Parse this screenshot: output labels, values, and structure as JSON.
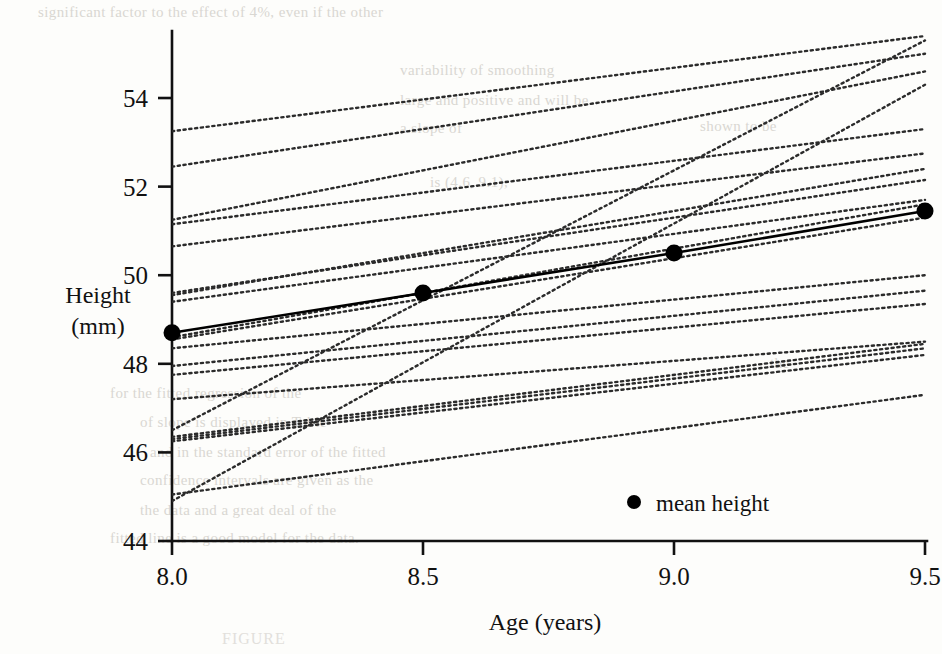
{
  "chart_data": {
    "type": "line",
    "title": "",
    "xlabel": "Age (years)",
    "ylabel": "Height (mm)",
    "ylabel_line1": "Height",
    "ylabel_line2": "(mm)",
    "xlim": [
      8.0,
      9.5
    ],
    "ylim": [
      44,
      55.4
    ],
    "xticks": [
      8.0,
      8.5,
      9.0,
      9.5
    ],
    "xticklabels": [
      "8.0",
      "8.5",
      "9.0",
      "9.5"
    ],
    "yticks": [
      44,
      46,
      48,
      50,
      52,
      54
    ],
    "yticklabels": [
      "44",
      "46",
      "48",
      "50",
      "52",
      "54"
    ],
    "grid": false,
    "legend": {
      "position": "inside-bottom-right",
      "entries": [
        {
          "label": "mean height",
          "marker": "filled-circle",
          "color": "#000000"
        }
      ]
    },
    "x": [
      8.0,
      9.5
    ],
    "series": [
      {
        "name": "mean height",
        "style": "solid",
        "marker": "filled-circle",
        "color": "#000000",
        "linewidth": 2.6,
        "x": [
          8.0,
          8.5,
          9.0,
          9.5
        ],
        "values": [
          48.7,
          49.6,
          50.5,
          51.45
        ]
      },
      {
        "name": "subject-01",
        "style": "dotted",
        "color": "#2b2b2b",
        "x": [
          8.0,
          9.5
        ],
        "values": [
          53.25,
          55.4
        ]
      },
      {
        "name": "subject-02",
        "style": "dotted",
        "color": "#2b2b2b",
        "x": [
          8.0,
          9.5
        ],
        "values": [
          52.45,
          55.0
        ]
      },
      {
        "name": "subject-03",
        "style": "dotted",
        "color": "#2b2b2b",
        "x": [
          8.0,
          9.5
        ],
        "values": [
          51.25,
          54.6
        ]
      },
      {
        "name": "subject-04",
        "style": "dotted",
        "color": "#2b2b2b",
        "x": [
          8.0,
          9.5
        ],
        "values": [
          51.15,
          53.3
        ]
      },
      {
        "name": "subject-05",
        "style": "dotted",
        "color": "#2b2b2b",
        "x": [
          8.0,
          9.5
        ],
        "values": [
          50.65,
          52.75
        ]
      },
      {
        "name": "subject-06",
        "style": "dotted",
        "color": "#2b2b2b",
        "x": [
          8.0,
          9.5
        ],
        "values": [
          49.6,
          52.15
        ]
      },
      {
        "name": "subject-07",
        "style": "dotted",
        "color": "#2b2b2b",
        "x": [
          8.0,
          9.5
        ],
        "values": [
          49.4,
          51.7
        ]
      },
      {
        "name": "subject-08",
        "style": "dotted",
        "color": "#2b2b2b",
        "x": [
          8.0,
          9.5
        ],
        "values": [
          48.55,
          51.3
        ]
      },
      {
        "name": "subject-09",
        "style": "dotted",
        "color": "#2b2b2b",
        "x": [
          8.0,
          9.5
        ],
        "values": [
          48.35,
          50.0
        ]
      },
      {
        "name": "subject-10",
        "style": "dotted",
        "color": "#2b2b2b",
        "x": [
          8.0,
          9.5
        ],
        "values": [
          47.95,
          49.65
        ]
      },
      {
        "name": "subject-11",
        "style": "dotted",
        "color": "#2b2b2b",
        "x": [
          8.0,
          9.5
        ],
        "values": [
          47.75,
          49.35
        ]
      },
      {
        "name": "subject-12",
        "style": "dotted",
        "color": "#2b2b2b",
        "x": [
          8.0,
          9.5
        ],
        "values": [
          47.2,
          48.5
        ]
      },
      {
        "name": "subject-13",
        "style": "dotted",
        "color": "#2b2b2b",
        "x": [
          8.0,
          9.5
        ],
        "values": [
          46.35,
          48.45
        ]
      },
      {
        "name": "subject-14",
        "style": "dotted",
        "color": "#2b2b2b",
        "x": [
          8.0,
          9.5
        ],
        "values": [
          46.3,
          48.35
        ]
      },
      {
        "name": "subject-15",
        "style": "dotted",
        "color": "#2b2b2b",
        "x": [
          8.0,
          9.5
        ],
        "values": [
          46.25,
          48.2
        ]
      },
      {
        "name": "subject-16",
        "style": "dotted",
        "color": "#2b2b2b",
        "x": [
          8.0,
          9.5
        ],
        "values": [
          45.05,
          47.3
        ]
      },
      {
        "name": "subject-17",
        "style": "dotted",
        "color": "#2b2b2b",
        "x": [
          8.0,
          9.5
        ],
        "values": [
          44.9,
          54.3
        ]
      },
      {
        "name": "subject-18",
        "style": "dotted",
        "color": "#2b2b2b",
        "x": [
          8.0,
          9.5
        ],
        "values": [
          46.5,
          55.3
        ]
      },
      {
        "name": "subject-19",
        "style": "dotted",
        "color": "#2b2b2b",
        "x": [
          8.0,
          9.5
        ],
        "values": [
          49.55,
          52.4
        ]
      },
      {
        "name": "subject-20",
        "style": "dotted",
        "color": "#2b2b2b",
        "x": [
          8.0,
          9.5
        ],
        "values": [
          48.6,
          51.6
        ]
      }
    ]
  },
  "caption": {
    "text": "FIGURE"
  },
  "bleed_text": [
    {
      "text": "significant factor to the effect of 4%, even if the other",
      "x": 38,
      "y": 4
    },
    {
      "text": "variability of smoothing",
      "x": 400,
      "y": 62
    },
    {
      "text": "large and positive and will be",
      "x": 400,
      "y": 92
    },
    {
      "text": "a slope of",
      "x": 400,
      "y": 120
    },
    {
      "text": "shown to be",
      "x": 700,
      "y": 118
    },
    {
      "text": "is (4.6, 9.1),",
      "x": 430,
      "y": 174
    },
    {
      "text": "the",
      "x": 770,
      "y": 355
    },
    {
      "text": "for  the  fitted  regression  of  the",
      "x": 110,
      "y": 385
    },
    {
      "text": "of slope is  displayed  in  Table",
      "x": 140,
      "y": 414
    },
    {
      "text": "and in the standard error of the fitted",
      "x": 150,
      "y": 444
    },
    {
      "text": "confidence intervals  are  given  as  the",
      "x": 140,
      "y": 472
    },
    {
      "text": "the  data  and  a  great  deal  of  the",
      "x": 140,
      "y": 502
    },
    {
      "text": "fitted line is a good model for the data.",
      "x": 110,
      "y": 530
    }
  ]
}
